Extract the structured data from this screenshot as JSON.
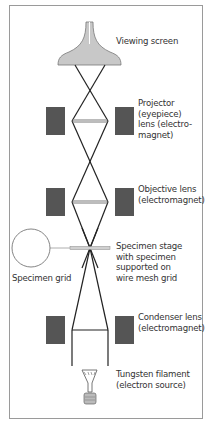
{
  "diagram": {
    "colors": {
      "border": "#9a9a9a",
      "magnet": "#555555",
      "screen_fill": "#c8c8c8",
      "beam": "#222222",
      "lens_bar": "#bdbdbd",
      "text": "#333333"
    },
    "labels": {
      "viewing_screen": "Viewing screen",
      "projector_lens": [
        "Projector",
        "(eyepiece)",
        "lens (electro-",
        "magnet)"
      ],
      "objective_lens": [
        "Objective lens",
        "(electromagnet)"
      ],
      "specimen_stage": [
        "Specimen stage",
        "with specimen",
        "supported on",
        "wire mesh grid"
      ],
      "specimen_grid": "Specimen grid",
      "condenser_lens": [
        "Condenser lens",
        "(electromagnet)"
      ],
      "tungsten_filament": [
        "Tungsten filament",
        "(electron source)"
      ]
    }
  }
}
